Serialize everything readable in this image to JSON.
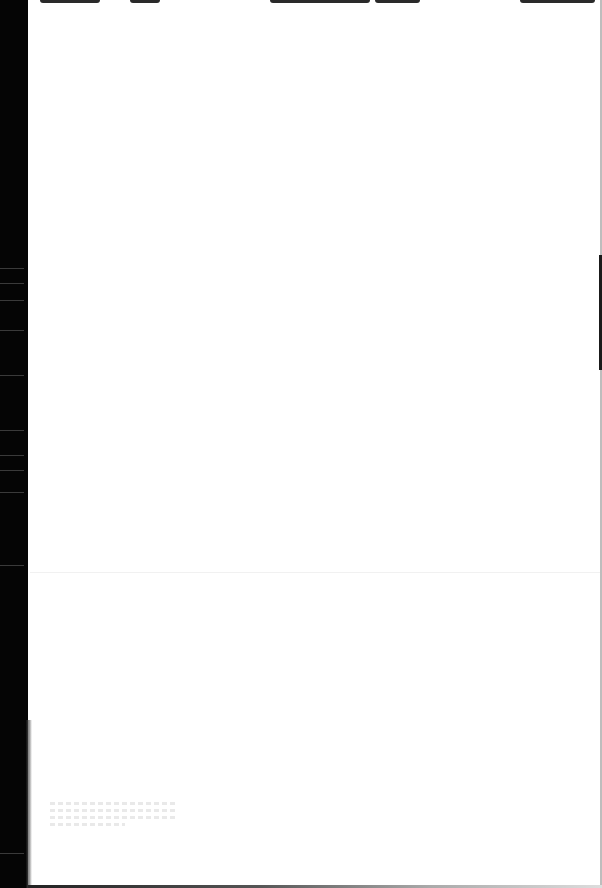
{
  "page": {
    "type": "scanned-blank-page",
    "width": 602,
    "height": 888,
    "background_color": "#ffffff",
    "text_content": ""
  },
  "binding_edge": {
    "side": "left",
    "color": "#050505",
    "width_px": 28
  },
  "right_edge": {
    "color": "#bdbdbd",
    "dark_segment_color": "#1a1a1a"
  },
  "top_smudges": [
    {
      "left": 40,
      "width": 60
    },
    {
      "left": 130,
      "width": 30
    },
    {
      "left": 270,
      "width": 100
    },
    {
      "left": 375,
      "width": 45
    },
    {
      "left": 520,
      "width": 75
    }
  ],
  "bleed_through": {
    "region": "bottom-left",
    "legible": false,
    "line_count": 4
  }
}
